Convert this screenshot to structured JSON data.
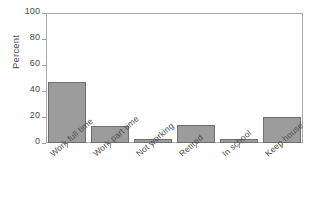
{
  "chart_data": {
    "type": "bar",
    "title": "",
    "xlabel": "",
    "ylabel": "Percent",
    "ylim": [
      0,
      100
    ],
    "yticks": [
      0,
      20,
      40,
      60,
      80,
      100
    ],
    "grid": false,
    "legend": false,
    "categories": [
      "Work full time",
      "Work part time",
      "Not working",
      "Retired",
      "In school",
      "Keep house"
    ],
    "values": [
      47,
      13,
      3,
      14,
      3,
      20
    ],
    "bar_fill_color": "#9c9c9c",
    "bar_edge_color": "#6f6f6f",
    "frame_color": "#a7a7a7",
    "text_color": "#4a4a4a",
    "background_color": "#ffffff"
  },
  "axes": {
    "y_title": "Percent",
    "y_tick_labels": [
      "0",
      "20",
      "40",
      "60",
      "80",
      "100"
    ]
  }
}
